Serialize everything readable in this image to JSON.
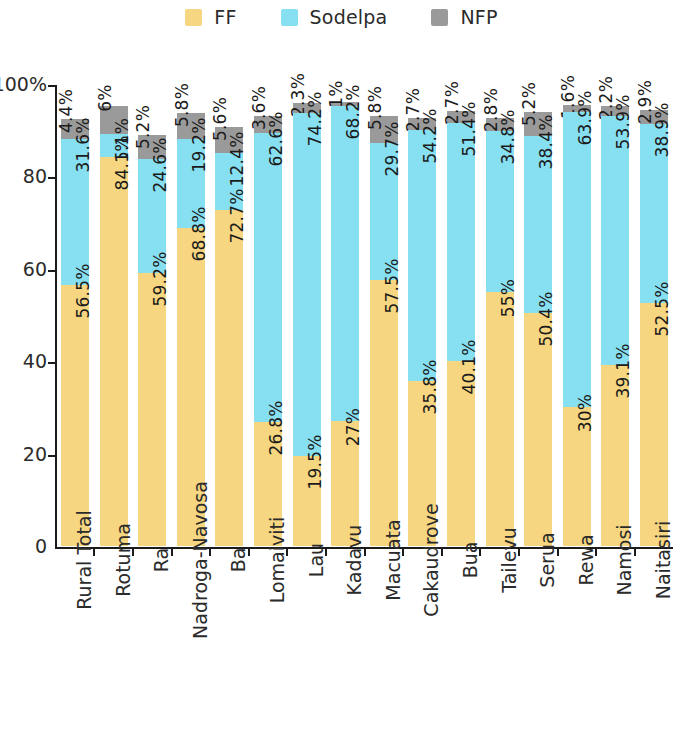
{
  "chart_data": {
    "type": "bar",
    "stacked": true,
    "title": "",
    "subtitle": "",
    "xlabel": "",
    "ylabel": "",
    "ylim": [
      0,
      100
    ],
    "ytick_values": [
      0,
      20,
      40,
      60,
      80,
      100
    ],
    "ytick_labels": [
      "0",
      "20",
      "40",
      "60",
      "80",
      "100%"
    ],
    "grid": false,
    "legend_position": "top-center",
    "categories": [
      "Rural Total",
      "Rotuma",
      "Ra",
      "Nadroga-Navosa",
      "Ba",
      "Lomaiviti",
      "Lau",
      "Kadavu",
      "Macuata",
      "Cakaudrove",
      "Bua",
      "Tailevu",
      "Serua",
      "Rewa",
      "Namosi",
      "Naitasiri"
    ],
    "series": [
      {
        "name": "FF",
        "color": "#f6d680",
        "values": [
          56.5,
          84.1,
          59.2,
          68.8,
          72.7,
          26.8,
          19.5,
          27,
          57.5,
          35.8,
          40.1,
          55,
          50.4,
          30,
          39.1,
          52.5
        ],
        "labels": [
          "56.5%",
          "84.1%",
          "59.2%",
          "68.8%",
          "72.7%",
          "26.8%",
          "19.5%",
          "27%",
          "57.5%",
          "35.8%",
          "40.1%",
          "55%",
          "50.4%",
          "30%",
          "39.1%",
          "52.5%"
        ]
      },
      {
        "name": "Sodelpa",
        "color": "#87dff2",
        "values": [
          31.6,
          5.1,
          24.6,
          19.2,
          12.4,
          62.6,
          74.2,
          68.2,
          29.7,
          54.2,
          51.4,
          34.8,
          38.4,
          63.9,
          53.9,
          38.9
        ],
        "labels": [
          "31.6%",
          "5.1%",
          "24.6%",
          "19.2%",
          "12.4%",
          "62.6%",
          "74.2%",
          "68.2%",
          "29.7%",
          "54.2%",
          "51.4%",
          "34.8%",
          "38.4%",
          "63.9%",
          "53.9%",
          "38.9%"
        ]
      },
      {
        "name": "NFP",
        "color": "#9a9a9a",
        "values": [
          4.4,
          6,
          5.2,
          5.8,
          5.6,
          3.6,
          2.3,
          1,
          5.8,
          2.7,
          2.7,
          2.8,
          5.2,
          1.6,
          2.2,
          2.9
        ],
        "labels": [
          "4.4%",
          "6%",
          "5.2%",
          "5.8%",
          "5.6%",
          "3.6%",
          "2.3%",
          "1%",
          "5.8%",
          "2.7%",
          "2.7%",
          "2.8%",
          "5.2%",
          "1.6%",
          "2.2%",
          "2.9%"
        ]
      }
    ]
  },
  "legend": {
    "items": [
      {
        "label": "FF",
        "color": "#f6d680"
      },
      {
        "label": "Sodelpa",
        "color": "#87dff2"
      },
      {
        "label": "NFP",
        "color": "#9a9a9a"
      }
    ]
  },
  "axes": {
    "y_labels": [
      "100%",
      "80",
      "60",
      "40",
      "20",
      "0"
    ]
  }
}
